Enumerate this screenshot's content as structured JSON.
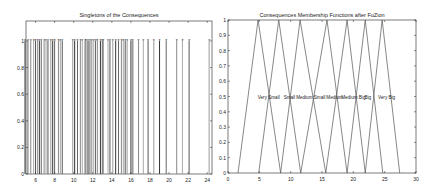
{
  "chart_data": [
    {
      "type": "stem",
      "title": "Singletons of the Consequences",
      "xlabel": "",
      "ylabel": "",
      "xlim": [
        5,
        24.5
      ],
      "ylim": [
        0,
        1.15
      ],
      "xticks": [
        6,
        8,
        10,
        12,
        14,
        16,
        18,
        20,
        22,
        24
      ],
      "yticks": [
        0,
        0.2,
        0.4,
        0.6,
        0.8,
        1
      ],
      "ytick_labels": [
        "0",
        "0.2",
        "0.4",
        "0.6",
        "0.8",
        "1"
      ],
      "grid": false,
      "marker": "asterisk",
      "x": [
        4.9,
        5.2,
        5.5,
        5.8,
        6.0,
        6.2,
        6.4,
        6.6,
        6.9,
        7.1,
        7.3,
        7.6,
        7.8,
        8.0,
        8.4,
        8.6,
        8.8,
        9.9,
        10.1,
        10.4,
        10.7,
        10.9,
        11.2,
        11.3,
        11.5,
        11.7,
        11.9,
        12.1,
        12.3,
        12.5,
        12.8,
        13.0,
        13.1,
        13.6,
        13.8,
        14.1,
        14.4,
        14.7,
        15.0,
        15.2,
        15.4,
        15.6,
        16.0,
        16.2,
        16.8,
        17.3,
        17.8,
        18.4,
        19.0,
        19.7,
        20.8,
        21.4,
        22.1,
        24.2
      ],
      "values": [
        1,
        1,
        1,
        1,
        1,
        1,
        1,
        1,
        1,
        1,
        1,
        1,
        1,
        1,
        1,
        1,
        1,
        1,
        1,
        1,
        1,
        1,
        1,
        1,
        1,
        1,
        1,
        1,
        1,
        1,
        1,
        1,
        1,
        1,
        1,
        1,
        1,
        1,
        1,
        1,
        1,
        1,
        1,
        1,
        1,
        1,
        1,
        1,
        1,
        1,
        1,
        1,
        1,
        1
      ]
    },
    {
      "type": "line",
      "title": "Consequences Membership Functions after FuZion",
      "xlabel": "",
      "ylabel": "",
      "xlim": [
        0,
        30
      ],
      "ylim": [
        0,
        1
      ],
      "xticks": [
        0,
        5,
        10,
        15,
        20,
        25,
        30
      ],
      "yticks": [
        0,
        0.1,
        0.2,
        0.3,
        0.4,
        0.5,
        0.6,
        0.7,
        0.8,
        0.9,
        1
      ],
      "ytick_labels": [
        "0",
        "0.1",
        "0.2",
        "0.3",
        "0.4",
        "0.5",
        "0.6",
        "0.7",
        "0.8",
        "0.9",
        "1"
      ],
      "grid": false,
      "series": [
        {
          "name": "Very Small",
          "type": "trimf",
          "params": [
            1.6,
            4.8,
            8.4
          ]
        },
        {
          "name": "Small",
          "type": "trimf",
          "params": [
            4.9,
            8.1,
            11.6
          ]
        },
        {
          "name": "Medium Small",
          "type": "trimf",
          "params": [
            8.4,
            11.5,
            15.6
          ]
        },
        {
          "name": "Medium",
          "type": "trimf",
          "params": [
            11.6,
            15.8,
            19.0
          ]
        },
        {
          "name": "Medium Big",
          "type": "trimf",
          "params": [
            15.6,
            19.0,
            21.9
          ]
        },
        {
          "name": "Big",
          "type": "trimf",
          "params": [
            19.0,
            21.9,
            24.7
          ]
        },
        {
          "name": "Very Big",
          "type": "trimf",
          "params": [
            21.9,
            24.6,
            27.4
          ]
        }
      ],
      "annotations": [
        {
          "text": "Very Small",
          "x": 6.5,
          "y": 0.5
        },
        {
          "text": "Small",
          "x": 9.8,
          "y": 0.5
        },
        {
          "text": "Medium Small",
          "x": 13.2,
          "y": 0.5
        },
        {
          "text": "Medium",
          "x": 17.0,
          "y": 0.5
        },
        {
          "text": "Medium Big",
          "x": 20.0,
          "y": 0.5
        },
        {
          "text": "Big",
          "x": 22.3,
          "y": 0.5
        },
        {
          "text": "Very Big",
          "x": 25.3,
          "y": 0.5
        }
      ]
    }
  ],
  "left": {
    "title": "Singletons of the Consequences"
  },
  "right": {
    "title": "Consequences Membership Functions after FuZion"
  },
  "colors": {
    "axes": "#222222",
    "stem": "#555555",
    "line": "#555555",
    "background": "#ffffff"
  }
}
